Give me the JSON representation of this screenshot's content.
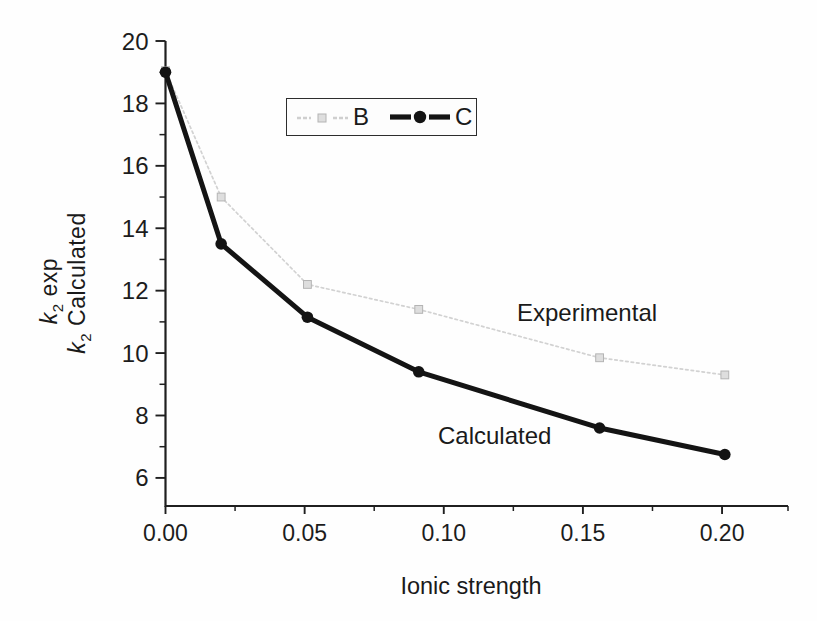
{
  "chart_data": {
    "type": "line",
    "title": "",
    "xlabel": "Ionic strength",
    "ylabel_lines": [
      {
        "var": "k",
        "sub": "2",
        "rest": " exp"
      },
      {
        "var": "k",
        "sub": "2",
        "rest": " Calculated"
      }
    ],
    "xlim": [
      0,
      0.2237
    ],
    "ylim": [
      5.1,
      20
    ],
    "grid": false,
    "x_major_ticks": {
      "values": [
        0,
        0.05,
        0.1,
        0.15,
        0.2
      ],
      "labels": [
        "0.00",
        "0.05",
        "0.10",
        "0.15",
        "0.20"
      ]
    },
    "x_minor_ticks": [
      0.025,
      0.075,
      0.125,
      0.175,
      0.2237
    ],
    "y_major_ticks": {
      "values": [
        20,
        18,
        16,
        14,
        12,
        10,
        8,
        6
      ],
      "labels": [
        "20",
        "18",
        "16",
        "14",
        "12",
        "10",
        "8",
        "6"
      ]
    },
    "y_minor_ticks": [
      19,
      17,
      15,
      13,
      11,
      9,
      7
    ],
    "series": [
      {
        "name": "B",
        "meaning": "Experimental",
        "marker": "square",
        "line_color": "#d2d2d2",
        "marker_fill": "#dedede",
        "marker_edge": "#b4b4b4",
        "line_width": 1.7,
        "dash": "2.5 3",
        "x": [
          0,
          0.02,
          0.051,
          0.091,
          0.156,
          0.201
        ],
        "y": [
          19.05,
          15.0,
          12.2,
          11.4,
          9.85,
          9.3
        ]
      },
      {
        "name": "C",
        "meaning": "Calculated",
        "marker": "circle",
        "line_color": "#141414",
        "marker_fill": "#131313",
        "marker_edge": "#131313",
        "line_width": 5,
        "dash": "",
        "x": [
          0,
          0.02,
          0.051,
          0.091,
          0.156,
          0.201
        ],
        "y": [
          19.0,
          13.5,
          11.15,
          9.4,
          7.6,
          6.75
        ]
      }
    ],
    "annotations": [
      {
        "text": "Experimental",
        "x": 0.152,
        "y": 11.3
      },
      {
        "text": "Calculated",
        "x": 0.118,
        "y": 7.3
      }
    ],
    "legend": {
      "position": "top-center",
      "entries": [
        {
          "label": "B"
        },
        {
          "label": "C"
        }
      ]
    }
  },
  "colors": {
    "axis": "#1f1f1f",
    "text": "#1a1a1a",
    "experimental_line": "#d2d2d2",
    "calculated_line": "#141414",
    "background": "#fefefe",
    "legend_border": "#2d2d2d"
  }
}
